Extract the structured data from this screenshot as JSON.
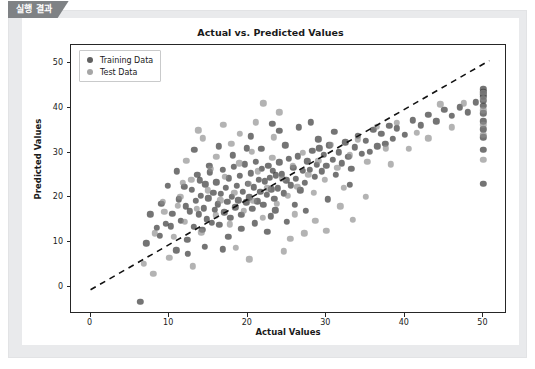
{
  "tab": {
    "label": "실행 결과"
  },
  "chart_data": {
    "type": "scatter",
    "title": "Actual vs. Predicted Values",
    "xlabel": "Actual Values",
    "ylabel": "Predicted Values",
    "xlim": [
      -2.5,
      53
    ],
    "ylim": [
      -6,
      54
    ],
    "xticks": [
      0,
      10,
      20,
      30,
      40,
      50
    ],
    "yticks": [
      0,
      10,
      20,
      30,
      40,
      50
    ],
    "xticklabels": [
      "0",
      "10",
      "20",
      "30",
      "40",
      "50"
    ],
    "yticklabels": [
      "0",
      "10",
      "20",
      "30",
      "40",
      "50"
    ],
    "grid": false,
    "legend": {
      "position": "upper left",
      "entries": [
        {
          "name": "Training Data",
          "color": "#3e3e3e"
        },
        {
          "name": "Test Data",
          "color": "#8c8c8c"
        }
      ]
    },
    "annotations": [
      {
        "kind": "reference-line",
        "style": "dashed",
        "color": "#111111",
        "description": "y = x ideal prediction line",
        "x": [
          0,
          51
        ],
        "y": [
          -1,
          50.5
        ]
      }
    ],
    "series": [
      {
        "name": "Training Data",
        "color": "#3e3e3e",
        "marker": "o",
        "alpha": 0.7,
        "points": [
          [
            6.3,
            -3.3
          ],
          [
            7.1,
            9.8
          ],
          [
            8.4,
            13.2
          ],
          [
            9.0,
            18.6
          ],
          [
            9.6,
            14.1
          ],
          [
            10.2,
            13.6
          ],
          [
            10.4,
            16.4
          ],
          [
            10.9,
            8.2
          ],
          [
            11.2,
            19.6
          ],
          [
            11.5,
            14.8
          ],
          [
            11.9,
            22.4
          ],
          [
            12.1,
            18.0
          ],
          [
            12.3,
            10.6
          ],
          [
            12.6,
            16.9
          ],
          [
            12.9,
            21.7
          ],
          [
            13.1,
            13.4
          ],
          [
            13.4,
            19.2
          ],
          [
            13.6,
            25.1
          ],
          [
            13.8,
            16.2
          ],
          [
            14.0,
            20.4
          ],
          [
            14.2,
            12.8
          ],
          [
            14.4,
            17.6
          ],
          [
            14.6,
            22.9
          ],
          [
            14.8,
            15.1
          ],
          [
            15.0,
            19.8
          ],
          [
            15.2,
            25.6
          ],
          [
            15.4,
            14.3
          ],
          [
            15.6,
            21.0
          ],
          [
            15.8,
            17.2
          ],
          [
            16.0,
            23.4
          ],
          [
            16.2,
            18.5
          ],
          [
            16.4,
            13.9
          ],
          [
            16.6,
            20.8
          ],
          [
            16.8,
            26.2
          ],
          [
            17.0,
            16.7
          ],
          [
            17.2,
            22.1
          ],
          [
            17.4,
            19.0
          ],
          [
            17.6,
            24.3
          ],
          [
            17.8,
            15.5
          ],
          [
            18.0,
            20.2
          ],
          [
            18.2,
            26.9
          ],
          [
            18.4,
            17.8
          ],
          [
            18.6,
            22.6
          ],
          [
            18.8,
            19.4
          ],
          [
            19.0,
            24.8
          ],
          [
            19.2,
            16.1
          ],
          [
            19.4,
            21.3
          ],
          [
            19.6,
            27.4
          ],
          [
            19.8,
            18.9
          ],
          [
            20.0,
            23.1
          ],
          [
            20.2,
            20.0
          ],
          [
            20.4,
            25.4
          ],
          [
            20.6,
            17.4
          ],
          [
            20.8,
            22.3
          ],
          [
            21.0,
            28.0
          ],
          [
            21.2,
            19.1
          ],
          [
            21.4,
            24.0
          ],
          [
            21.6,
            21.2
          ],
          [
            21.8,
            26.4
          ],
          [
            22.0,
            18.3
          ],
          [
            22.2,
            23.6
          ],
          [
            22.4,
            20.6
          ],
          [
            22.6,
            27.1
          ],
          [
            22.8,
            24.4
          ],
          [
            23.0,
            21.8
          ],
          [
            23.2,
            26.0
          ],
          [
            23.4,
            19.7
          ],
          [
            23.6,
            24.9
          ],
          [
            23.8,
            22.0
          ],
          [
            24.0,
            27.8
          ],
          [
            24.3,
            25.2
          ],
          [
            24.6,
            20.9
          ],
          [
            24.9,
            23.8
          ],
          [
            25.2,
            28.6
          ],
          [
            25.5,
            22.7
          ],
          [
            25.8,
            26.6
          ],
          [
            26.1,
            24.1
          ],
          [
            26.4,
            29.2
          ],
          [
            26.7,
            21.6
          ],
          [
            27.0,
            25.9
          ],
          [
            27.3,
            23.3
          ],
          [
            27.6,
            28.1
          ],
          [
            27.9,
            26.2
          ],
          [
            28.2,
            30.4
          ],
          [
            28.5,
            24.6
          ],
          [
            28.8,
            27.3
          ],
          [
            29.1,
            31.0
          ],
          [
            29.4,
            25.8
          ],
          [
            29.7,
            29.5
          ],
          [
            30.0,
            27.0
          ],
          [
            30.4,
            31.6
          ],
          [
            30.8,
            28.4
          ],
          [
            31.2,
            25.0
          ],
          [
            31.6,
            30.1
          ],
          [
            32.0,
            27.6
          ],
          [
            32.4,
            32.3
          ],
          [
            32.8,
            29.0
          ],
          [
            33.2,
            26.4
          ],
          [
            33.6,
            31.2
          ],
          [
            34.0,
            33.8
          ],
          [
            34.5,
            29.8
          ],
          [
            35.0,
            32.6
          ],
          [
            35.5,
            30.2
          ],
          [
            36.0,
            35.1
          ],
          [
            36.5,
            31.4
          ],
          [
            37.0,
            34.2
          ],
          [
            37.5,
            32.0
          ],
          [
            38.0,
            36.0
          ],
          [
            38.5,
            33.1
          ],
          [
            39.0,
            35.4
          ],
          [
            40.0,
            34.0
          ],
          [
            41.0,
            37.2
          ],
          [
            42.0,
            36.1
          ],
          [
            43.0,
            38.4
          ],
          [
            44.0,
            37.0
          ],
          [
            45.0,
            39.6
          ],
          [
            46.0,
            38.2
          ],
          [
            47.0,
            40.1
          ],
          [
            48.0,
            39.0
          ],
          [
            49.0,
            41.2
          ],
          [
            50.0,
            23.1
          ],
          [
            50.0,
            30.6
          ],
          [
            50.0,
            33.4
          ],
          [
            50.0,
            35.2
          ],
          [
            50.0,
            37.0
          ],
          [
            50.0,
            38.8
          ],
          [
            50.0,
            40.4
          ],
          [
            50.0,
            41.6
          ],
          [
            50.0,
            42.4
          ],
          [
            50.0,
            43.0
          ],
          [
            50.0,
            43.6
          ],
          [
            50.0,
            44.1
          ],
          [
            13.2,
            30.6
          ],
          [
            16.3,
            31.4
          ],
          [
            20.4,
            33.6
          ],
          [
            23.1,
            36.4
          ],
          [
            24.0,
            34.8
          ],
          [
            26.5,
            35.6
          ],
          [
            28.0,
            36.8
          ],
          [
            18.1,
            29.4
          ],
          [
            21.7,
            30.8
          ],
          [
            9.8,
            22.6
          ],
          [
            11.0,
            25.8
          ],
          [
            17.5,
            11.2
          ],
          [
            19.2,
            13.0
          ],
          [
            22.5,
            12.4
          ],
          [
            25.0,
            14.6
          ],
          [
            23.5,
            17.1
          ],
          [
            26.0,
            18.4
          ],
          [
            27.4,
            17.0
          ],
          [
            30.2,
            19.6
          ],
          [
            33.0,
            22.8
          ],
          [
            12.4,
            7.4
          ],
          [
            14.5,
            9.0
          ],
          [
            16.8,
            8.4
          ],
          [
            8.8,
            11.4
          ],
          [
            7.6,
            16.2
          ],
          [
            24.8,
            31.6
          ],
          [
            29.0,
            33.0
          ],
          [
            31.0,
            34.6
          ],
          [
            20.9,
            14.2
          ],
          [
            22.9,
            15.8
          ],
          [
            13.9,
            23.8
          ],
          [
            15.1,
            27.0
          ],
          [
            19.9,
            31.0
          ]
        ]
      },
      {
        "name": "Test Data",
        "color": "#8c8c8c",
        "marker": "o",
        "alpha": 0.6,
        "points": [
          [
            6.8,
            5.2
          ],
          [
            8.2,
            12.0
          ],
          [
            9.4,
            16.8
          ],
          [
            10.6,
            11.2
          ],
          [
            11.4,
            20.1
          ],
          [
            12.0,
            14.6
          ],
          [
            12.8,
            24.0
          ],
          [
            13.5,
            17.4
          ],
          [
            14.1,
            12.2
          ],
          [
            14.9,
            21.6
          ],
          [
            15.3,
            26.4
          ],
          [
            15.9,
            16.0
          ],
          [
            16.5,
            19.4
          ],
          [
            17.1,
            24.6
          ],
          [
            17.7,
            14.0
          ],
          [
            18.3,
            21.0
          ],
          [
            18.9,
            27.6
          ],
          [
            19.5,
            17.0
          ],
          [
            20.1,
            23.0
          ],
          [
            20.7,
            19.2
          ],
          [
            21.3,
            25.8
          ],
          [
            21.9,
            15.4
          ],
          [
            22.5,
            22.0
          ],
          [
            23.1,
            28.8
          ],
          [
            23.7,
            18.6
          ],
          [
            24.4,
            24.2
          ],
          [
            25.1,
            20.4
          ],
          [
            25.7,
            27.0
          ],
          [
            26.3,
            22.4
          ],
          [
            27.0,
            30.0
          ],
          [
            27.7,
            25.0
          ],
          [
            28.4,
            21.0
          ],
          [
            29.0,
            28.2
          ],
          [
            29.8,
            24.0
          ],
          [
            30.6,
            31.8
          ],
          [
            31.4,
            26.6
          ],
          [
            32.2,
            22.1
          ],
          [
            33.0,
            29.4
          ],
          [
            34.0,
            33.0
          ],
          [
            35.2,
            28.0
          ],
          [
            36.4,
            35.8
          ],
          [
            37.6,
            31.0
          ],
          [
            39.0,
            36.6
          ],
          [
            41.5,
            34.4
          ],
          [
            44.5,
            40.8
          ],
          [
            47.5,
            41.0
          ],
          [
            50.0,
            28.4
          ],
          [
            50.0,
            34.0
          ],
          [
            50.0,
            36.2
          ],
          [
            50.0,
            39.4
          ],
          [
            50.0,
            42.0
          ],
          [
            50.0,
            43.4
          ],
          [
            8.0,
            3.0
          ],
          [
            10.0,
            6.6
          ],
          [
            13.0,
            4.6
          ],
          [
            16.0,
            29.0
          ],
          [
            19.0,
            34.2
          ],
          [
            21.0,
            36.8
          ],
          [
            24.0,
            39.0
          ],
          [
            22.0,
            41.0
          ],
          [
            26.0,
            16.2
          ],
          [
            28.6,
            14.8
          ],
          [
            31.8,
            18.0
          ],
          [
            35.0,
            20.2
          ],
          [
            12.2,
            28.2
          ],
          [
            14.3,
            33.2
          ],
          [
            17.9,
            32.0
          ],
          [
            20.5,
            30.2
          ],
          [
            23.3,
            33.4
          ],
          [
            9.2,
            19.0
          ],
          [
            11.7,
            23.2
          ],
          [
            18.5,
            8.8
          ],
          [
            20.2,
            6.2
          ],
          [
            25.4,
            10.8
          ],
          [
            30.0,
            12.6
          ],
          [
            33.4,
            15.0
          ],
          [
            38.2,
            27.4
          ],
          [
            40.5,
            30.8
          ],
          [
            43.0,
            33.2
          ],
          [
            46.0,
            35.6
          ],
          [
            16.9,
            36.2
          ],
          [
            13.7,
            35.0
          ],
          [
            27.2,
            12.0
          ],
          [
            24.6,
            8.0
          ],
          [
            11.1,
            18.2
          ]
        ]
      }
    ]
  }
}
